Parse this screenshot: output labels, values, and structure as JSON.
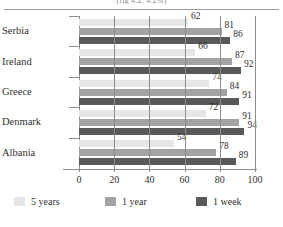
{
  "caption_fragment": "(fig 4.2:  4.2%)",
  "chart_data": {
    "type": "bar",
    "orientation": "horizontal",
    "title": "",
    "xlabel": "",
    "ylabel": "",
    "xlim": [
      0,
      100
    ],
    "xticks": [
      0,
      20,
      40,
      60,
      80,
      100
    ],
    "grid": true,
    "legend_position": "bottom",
    "categories": [
      "Serbia",
      "Ireland",
      "Greece",
      "Denmark",
      "Albania"
    ],
    "series": [
      {
        "name": "5 years",
        "color": "#e6e6e6",
        "values": [
          62,
          66,
          74,
          72,
          54
        ]
      },
      {
        "name": "1 year",
        "color": "#a3a3a3",
        "values": [
          81,
          87,
          84,
          91,
          78
        ]
      },
      {
        "name": "1 week",
        "color": "#595959",
        "values": [
          86,
          92,
          91,
          94,
          89
        ]
      }
    ]
  }
}
